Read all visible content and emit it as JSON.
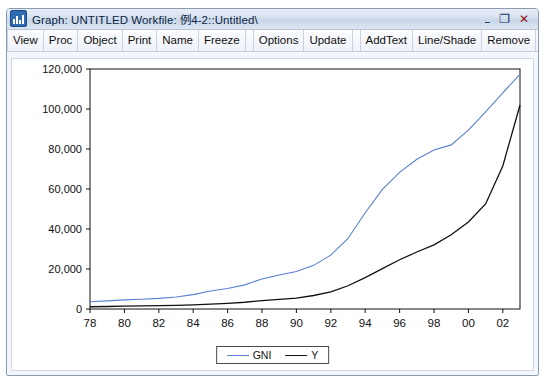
{
  "window": {
    "title": "Graph: UNTITLED   Workfile: 例4-2::Untitled\\",
    "icon": "chart-bars-icon",
    "buttons": {
      "minimize": "–",
      "maximize": "❐",
      "close": "✕"
    }
  },
  "toolbar": {
    "items": [
      {
        "label": "View"
      },
      {
        "label": "Proc"
      },
      {
        "label": "Object"
      },
      {
        "label": "Print"
      },
      {
        "label": "Name"
      },
      {
        "label": "Freeze"
      },
      {
        "label": "Options"
      },
      {
        "label": "Update"
      },
      {
        "label": "AddText"
      },
      {
        "label": "Line/Shade"
      },
      {
        "label": "Remove"
      }
    ]
  },
  "chart_data": {
    "type": "line",
    "title": "",
    "xlabel": "",
    "ylabel": "",
    "grid": false,
    "legend_position": "bottom-center",
    "ylim": [
      0,
      120000
    ],
    "yticks": [
      0,
      20000,
      40000,
      60000,
      80000,
      100000,
      120000
    ],
    "ytick_labels": [
      "0",
      "20,000",
      "40,000",
      "60,000",
      "80,000",
      "100,000",
      "120,000"
    ],
    "xticks": [
      78,
      80,
      82,
      84,
      86,
      88,
      90,
      92,
      94,
      96,
      98,
      100,
      102
    ],
    "xtick_labels": [
      "78",
      "80",
      "82",
      "84",
      "86",
      "88",
      "90",
      "92",
      "94",
      "96",
      "98",
      "00",
      "02"
    ],
    "x": [
      78,
      79,
      80,
      81,
      82,
      83,
      84,
      85,
      86,
      87,
      88,
      89,
      90,
      91,
      92,
      93,
      94,
      95,
      96,
      97,
      98,
      99,
      100,
      101,
      102,
      103
    ],
    "series": [
      {
        "name": "GNI",
        "color": "#5a7fd0",
        "values": [
          3645,
          4063,
          4546,
          4892,
          5323,
          5963,
          7208,
          9016,
          10275,
          12059,
          15037,
          17001,
          18718,
          21826,
          26937,
          35260,
          48108,
          59811,
          68330,
          74894,
          79554,
          82055,
          89404,
          98563,
          108068,
          117252
        ]
      },
      {
        "name": "Y",
        "color": "#111111",
        "values": [
          1132,
          1246,
          1402,
          1528,
          1661,
          1806,
          2064,
          2471,
          2853,
          3380,
          4208,
          4787,
          5484,
          6745,
          8529,
          11617,
          15725,
          20200,
          24625,
          28500,
          32100,
          37100,
          43500,
          52500,
          71500,
          102000
        ]
      }
    ]
  }
}
